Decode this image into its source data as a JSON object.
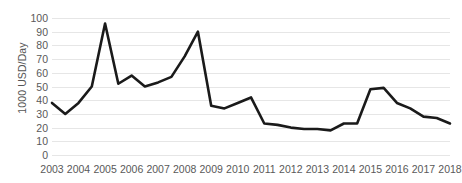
{
  "chart_data": {
    "type": "line",
    "title": "",
    "subtitle": "",
    "xlabel": "",
    "ylabel": "1000 USD/Day",
    "ylim": [
      0,
      100
    ],
    "ytick_labels": [
      "100",
      "90",
      "80",
      "70",
      "60",
      "50",
      "40",
      "30",
      "20",
      "10",
      "0"
    ],
    "ytick_values": [
      100,
      90,
      80,
      70,
      60,
      50,
      40,
      30,
      20,
      10,
      0
    ],
    "xtick_labels": [
      "2003",
      "2004",
      "2005",
      "2006",
      "2007",
      "2008",
      "2009",
      "2010",
      "2011",
      "2012",
      "2013",
      "2014",
      "2015",
      "2016",
      "2017",
      "2018"
    ],
    "xtick_values": [
      2003,
      2004,
      2005,
      2006,
      2007,
      2008,
      2009,
      2010,
      2011,
      2012,
      2013,
      2014,
      2015,
      2016,
      2017,
      2018
    ],
    "xlim": [
      2003,
      2018
    ],
    "grid": "horizontal",
    "legend": "none",
    "line_color": "#1a1a1a",
    "line_width": 2.6,
    "gridline_color": "#e6e6e6",
    "tick_label_color": "#595959",
    "axis_title_color": "#555555",
    "background_color": "#ffffff",
    "x": [
      2003.0,
      2003.5,
      2004.0,
      2004.5,
      2005.0,
      2005.5,
      2006.0,
      2006.5,
      2007.0,
      2007.5,
      2008.0,
      2008.5,
      2009.0,
      2009.5,
      2010.0,
      2010.5,
      2011.0,
      2011.5,
      2012.0,
      2012.5,
      2013.0,
      2013.5,
      2014.0,
      2014.5,
      2015.0,
      2015.5,
      2016.0,
      2016.5,
      2017.0,
      2017.5,
      2018.0
    ],
    "values": [
      38,
      30,
      38,
      50,
      96,
      52,
      58,
      50,
      53,
      57,
      72,
      90,
      36,
      34,
      38,
      42,
      23,
      22,
      20,
      19,
      19,
      18,
      23,
      23,
      48,
      49,
      38,
      34,
      28,
      27,
      23
    ],
    "series": [
      {
        "name": "1000 USD/Day",
        "values": [
          38,
          30,
          38,
          50,
          96,
          52,
          58,
          50,
          53,
          57,
          72,
          90,
          36,
          34,
          38,
          42,
          23,
          22,
          20,
          19,
          19,
          18,
          23,
          23,
          48,
          49,
          38,
          34,
          28,
          27,
          23
        ]
      }
    ],
    "annotations": []
  }
}
